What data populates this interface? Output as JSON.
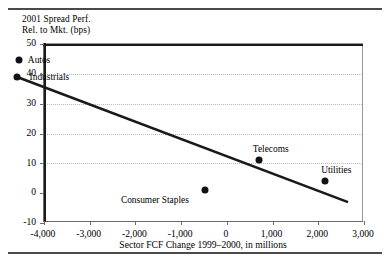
{
  "figure": {
    "y_axis_title": "2001 Spread Perf.\nRel. to Mkt. (bps)",
    "x_axis_title": "Sector FCF Change 1999–2000, in millions"
  },
  "chart_data": {
    "type": "scatter",
    "title": "",
    "xlabel": "Sector FCF Change 1999–2000, in millions",
    "ylabel": "2001 Spread Perf. Rel. to Mkt. (bps)",
    "xlim": [
      -4000,
      3000
    ],
    "ylim": [
      -10,
      50
    ],
    "xticks": [
      -4000,
      -3000,
      -2000,
      -1000,
      0,
      1000,
      2000,
      3000
    ],
    "xticklabels": [
      "-4,000",
      "-3,000",
      "-2,000",
      "-1,000",
      "0",
      "1,000",
      "2,000",
      "3,000"
    ],
    "yticks": [
      -10,
      0,
      10,
      20,
      30,
      40,
      50
    ],
    "yticklabels": [
      "-10",
      "0",
      "10",
      "20",
      "30",
      "40",
      "50"
    ],
    "grid": "horizontal-dotted",
    "legend": "none",
    "zero_lines": {
      "x": 0,
      "y": 0,
      "color": "#1a1a1a"
    },
    "points": [
      {
        "label": "Autos",
        "x": -4550,
        "y": 44.5,
        "label_dx": 9,
        "label_dy": 0
      },
      {
        "label": "Industrials",
        "x": -4600,
        "y": 39.0,
        "label_dx": 13,
        "label_dy": 1
      },
      {
        "label": "Consumer Staples",
        "x": -480,
        "y": 1.0,
        "label_dx": -84,
        "label_dy": 11
      },
      {
        "label": "Telecoms",
        "x": 700,
        "y": 11.0,
        "label_dx": -6,
        "label_dy": -11
      },
      {
        "label": "Utilities",
        "x": 2150,
        "y": 4.0,
        "label_dx": -4,
        "label_dy": -11
      }
    ],
    "trendline": {
      "x0": -4600,
      "y0": 39.0,
      "x1": 2650,
      "y1": -3.0,
      "color": "#1a1a1a",
      "width": 2.6
    },
    "marker_color": "#111111"
  }
}
